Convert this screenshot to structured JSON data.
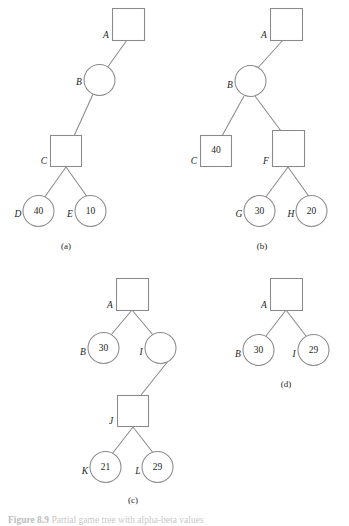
{
  "figure": {
    "caption_label": "Figure 8.9",
    "caption_text": "Partial game tree with alpha-beta values",
    "colors": {
      "stroke": "#8a8a8d",
      "text": "#231f20",
      "background": "#ffffff"
    }
  },
  "subfigures": [
    {
      "key": "a",
      "caption": "(a)",
      "nodes": [
        {
          "id": "A",
          "label": "A",
          "shape": "square",
          "value": ""
        },
        {
          "id": "B",
          "label": "B",
          "shape": "circle",
          "value": ""
        },
        {
          "id": "C",
          "label": "C",
          "shape": "square",
          "value": ""
        },
        {
          "id": "D",
          "label": "D",
          "shape": "circle",
          "value": "40"
        },
        {
          "id": "E",
          "label": "E",
          "shape": "circle",
          "value": "10"
        }
      ],
      "edges": [
        [
          "A",
          "B"
        ],
        [
          "B",
          "C"
        ],
        [
          "C",
          "D"
        ],
        [
          "C",
          "E"
        ]
      ]
    },
    {
      "key": "b",
      "caption": "(b)",
      "nodes": [
        {
          "id": "A",
          "label": "A",
          "shape": "square",
          "value": ""
        },
        {
          "id": "B",
          "label": "B",
          "shape": "circle",
          "value": ""
        },
        {
          "id": "C",
          "label": "C",
          "shape": "square",
          "value": "40"
        },
        {
          "id": "F",
          "label": "F",
          "shape": "square",
          "value": ""
        },
        {
          "id": "G",
          "label": "G",
          "shape": "circle",
          "value": "30"
        },
        {
          "id": "H",
          "label": "H",
          "shape": "circle",
          "value": "20"
        }
      ],
      "edges": [
        [
          "A",
          "B"
        ],
        [
          "B",
          "C"
        ],
        [
          "B",
          "F"
        ],
        [
          "F",
          "G"
        ],
        [
          "F",
          "H"
        ]
      ]
    },
    {
      "key": "c",
      "caption": "(c)",
      "nodes": [
        {
          "id": "A",
          "label": "A",
          "shape": "square",
          "value": ""
        },
        {
          "id": "B",
          "label": "B",
          "shape": "circle",
          "value": "30"
        },
        {
          "id": "I",
          "label": "I",
          "shape": "circle",
          "value": ""
        },
        {
          "id": "J",
          "label": "J",
          "shape": "square",
          "value": ""
        },
        {
          "id": "K",
          "label": "K",
          "shape": "circle",
          "value": "21"
        },
        {
          "id": "L",
          "label": "L",
          "shape": "circle",
          "value": "29"
        }
      ],
      "edges": [
        [
          "A",
          "B"
        ],
        [
          "A",
          "I"
        ],
        [
          "I",
          "J"
        ],
        [
          "J",
          "K"
        ],
        [
          "J",
          "L"
        ]
      ]
    },
    {
      "key": "d",
      "caption": "(d)",
      "nodes": [
        {
          "id": "A",
          "label": "A",
          "shape": "square",
          "value": ""
        },
        {
          "id": "B",
          "label": "B",
          "shape": "circle",
          "value": "30"
        },
        {
          "id": "I",
          "label": "I",
          "shape": "circle",
          "value": "29"
        }
      ],
      "edges": [
        [
          "A",
          "B"
        ],
        [
          "A",
          "I"
        ]
      ]
    }
  ]
}
